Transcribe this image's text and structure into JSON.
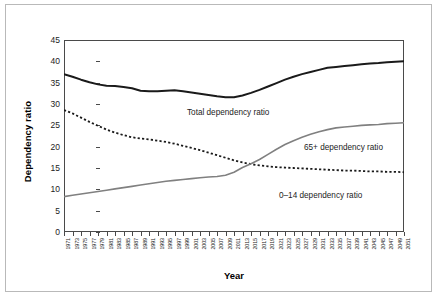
{
  "figure": {
    "y_axis_title": "Dependency ratio",
    "x_axis_title": "Year"
  },
  "annotations": {
    "total": "Total dependency ratio",
    "sixtyfive_plus": "65+ dependency ratio",
    "zero_to_fourteen": "0–14 dependency ratio"
  },
  "colors": {
    "total_line": "#1a1a1a",
    "zero_to_fourteen_line": "#1a1a1a",
    "sixtyfive_plus_line": "#808080",
    "axis": "#4a4a4a",
    "outer_frame": "#b9b9b9",
    "background": "#ffffff"
  },
  "chart_data": {
    "type": "line",
    "title": "",
    "subtitle": "",
    "xlabel": "Year",
    "ylabel": "Dependency ratio",
    "xlim": [
      1971,
      2051
    ],
    "ylim": [
      0,
      45
    ],
    "yticks": [
      0,
      5,
      10,
      15,
      20,
      25,
      30,
      35,
      40,
      45
    ],
    "grid": false,
    "legend_position": "inline-annotations",
    "tick_label_rotation": -90,
    "tick_interval_years": 2,
    "x": [
      1971,
      1973,
      1975,
      1977,
      1979,
      1981,
      1983,
      1985,
      1987,
      1989,
      1991,
      1993,
      1995,
      1997,
      1999,
      2001,
      2003,
      2005,
      2007,
      2009,
      2011,
      2013,
      2015,
      2017,
      2019,
      2021,
      2023,
      2025,
      2027,
      2029,
      2031,
      2033,
      2035,
      2037,
      2039,
      2041,
      2043,
      2045,
      2047,
      2049,
      2051
    ],
    "xticklabels": [
      "1971",
      "1973",
      "1975",
      "1977",
      "1979",
      "1981",
      "1983",
      "1985",
      "1987",
      "1989",
      "1991",
      "1993",
      "1995",
      "1997",
      "1999",
      "2001",
      "2003",
      "2005",
      "2007",
      "2009",
      "2011",
      "2013",
      "2015",
      "2017",
      "2019",
      "2021",
      "2023",
      "2025",
      "2027",
      "2029",
      "2031",
      "2033",
      "2035",
      "2037",
      "2039",
      "2041",
      "2043",
      "2045",
      "2047",
      "2049",
      "2051"
    ],
    "series": [
      {
        "name": "Total dependency ratio",
        "style": "solid",
        "color": "#1a1a1a",
        "width": 2.0,
        "values": [
          37.0,
          36.4,
          35.7,
          35.1,
          34.6,
          34.3,
          34.2,
          34.0,
          33.7,
          33.1,
          33.0,
          33.0,
          33.1,
          33.2,
          33.0,
          32.7,
          32.4,
          32.1,
          31.8,
          31.6,
          31.6,
          32.0,
          32.6,
          33.3,
          34.1,
          34.9,
          35.7,
          36.4,
          37.0,
          37.5,
          38.0,
          38.5,
          38.7,
          38.9,
          39.1,
          39.3,
          39.5,
          39.6,
          39.8,
          39.9,
          40.0
        ]
      },
      {
        "name": "0–14 dependency ratio",
        "style": "dotted",
        "color": "#1a1a1a",
        "width": 1.8,
        "values": [
          28.6,
          27.8,
          26.8,
          25.8,
          24.9,
          24.0,
          23.3,
          22.7,
          22.2,
          21.9,
          21.7,
          21.4,
          21.1,
          20.7,
          20.2,
          19.7,
          19.2,
          18.6,
          18.0,
          17.4,
          16.8,
          16.3,
          15.9,
          15.6,
          15.4,
          15.2,
          15.1,
          15.0,
          14.9,
          14.8,
          14.7,
          14.6,
          14.5,
          14.4,
          14.4,
          14.3,
          14.2,
          14.2,
          14.1,
          14.1,
          14.0
        ]
      },
      {
        "name": "65+ dependency ratio",
        "style": "solid",
        "color": "#808080",
        "width": 1.6,
        "values": [
          8.3,
          8.6,
          8.9,
          9.2,
          9.5,
          9.8,
          10.1,
          10.4,
          10.7,
          11.0,
          11.3,
          11.6,
          11.9,
          12.1,
          12.3,
          12.5,
          12.7,
          12.9,
          13.0,
          13.3,
          14.0,
          15.1,
          16.0,
          17.0,
          18.2,
          19.4,
          20.5,
          21.4,
          22.2,
          22.9,
          23.5,
          24.0,
          24.4,
          24.6,
          24.8,
          25.0,
          25.1,
          25.2,
          25.4,
          25.5,
          25.6
        ]
      }
    ]
  }
}
